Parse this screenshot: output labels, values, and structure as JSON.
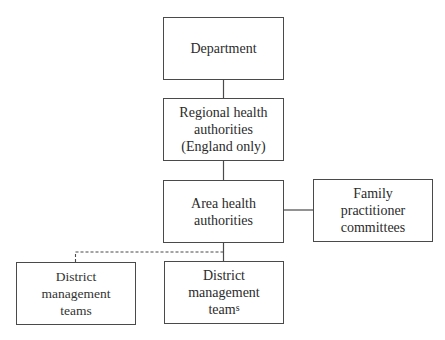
{
  "diagram": {
    "type": "organizational-hierarchy",
    "nodes": [
      {
        "id": "department",
        "lines": [
          "Department"
        ]
      },
      {
        "id": "regional",
        "lines": [
          "Regional health",
          "authorities",
          "(England only)"
        ]
      },
      {
        "id": "area",
        "lines": [
          "Area health",
          "authorities"
        ]
      },
      {
        "id": "family",
        "lines": [
          "Family",
          "practitioner",
          "committees"
        ]
      },
      {
        "id": "district_left",
        "lines": [
          "District",
          "management",
          "teams"
        ]
      },
      {
        "id": "district_right",
        "lines": [
          "District",
          "management",
          "team"
        ],
        "suffix_raised": "s"
      }
    ],
    "edges": [
      {
        "from": "department",
        "to": "regional",
        "style": "solid"
      },
      {
        "from": "regional",
        "to": "area",
        "style": "solid"
      },
      {
        "from": "area",
        "to": "family",
        "style": "solid"
      },
      {
        "from": "area",
        "to": "district_right",
        "style": "solid"
      },
      {
        "from": "area",
        "to": "district_left",
        "style": "dashed"
      }
    ],
    "colors": {
      "border": "#4a4a4a",
      "text": "#2b2b2b",
      "background": "#ffffff"
    }
  }
}
